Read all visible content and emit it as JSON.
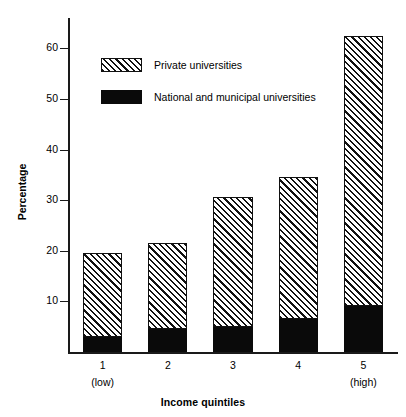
{
  "chart_data": {
    "type": "bar",
    "subtype": "stacked-bar",
    "title": "",
    "xlabel": "Income quintiles",
    "ylabel": "Percentage",
    "categories": [
      "1",
      "2",
      "3",
      "4",
      "5"
    ],
    "category_sublabels": [
      "(low)",
      "",
      "",
      "",
      "(high)"
    ],
    "series": [
      {
        "name": "National and municipal universities",
        "values": [
          3.0,
          4.5,
          5.0,
          6.5,
          9.0
        ],
        "fill": "solid-black",
        "color": "#0a0a0a"
      },
      {
        "name": "Private universities",
        "values": [
          16.5,
          17.0,
          25.7,
          28.0,
          53.4
        ],
        "fill": "diagonal-hatch",
        "color": "#111111"
      }
    ],
    "totals": [
      19.5,
      21.5,
      30.7,
      34.5,
      62.4
    ],
    "ylim": [
      0,
      66
    ],
    "yticks": [
      10,
      20,
      30,
      40,
      50,
      60
    ],
    "ytick_labels": [
      "10",
      "20",
      "30",
      "40",
      "50",
      "60"
    ],
    "grid": false,
    "legend_position": "upper-left-inside",
    "stack_order": [
      "National and municipal universities",
      "Private universities"
    ]
  },
  "legend": {
    "items": [
      {
        "label": "Private universities",
        "swatch": "hatched-swatch"
      },
      {
        "label": "National and municipal universities",
        "swatch": "solid-black-swatch"
      }
    ]
  },
  "axes": {
    "y_title": "Percentage",
    "x_title": "Income quintiles"
  }
}
